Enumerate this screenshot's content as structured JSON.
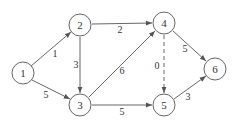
{
  "graph": {
    "nodes": [
      {
        "id": "1",
        "label": "1",
        "x": 23,
        "y": 73
      },
      {
        "id": "2",
        "label": "2",
        "x": 80,
        "y": 25
      },
      {
        "id": "3",
        "label": "3",
        "x": 80,
        "y": 105
      },
      {
        "id": "4",
        "label": "4",
        "x": 164,
        "y": 23
      },
      {
        "id": "5",
        "label": "5",
        "x": 164,
        "y": 105
      },
      {
        "id": "6",
        "label": "6",
        "x": 215,
        "y": 69
      }
    ],
    "edges": [
      {
        "from": "1",
        "to": "2",
        "weight": "1",
        "style": "solid"
      },
      {
        "from": "1",
        "to": "3",
        "weight": "5",
        "style": "solid"
      },
      {
        "from": "2",
        "to": "4",
        "weight": "2",
        "style": "solid"
      },
      {
        "from": "2",
        "to": "3",
        "weight": "3",
        "style": "solid"
      },
      {
        "from": "3",
        "to": "4",
        "weight": "6",
        "style": "solid"
      },
      {
        "from": "3",
        "to": "5",
        "weight": "5",
        "style": "solid"
      },
      {
        "from": "4",
        "to": "5",
        "weight": "0",
        "style": "dashed"
      },
      {
        "from": "4",
        "to": "6",
        "weight": "5",
        "style": "solid"
      },
      {
        "from": "5",
        "to": "6",
        "weight": "3",
        "style": "solid"
      }
    ]
  }
}
